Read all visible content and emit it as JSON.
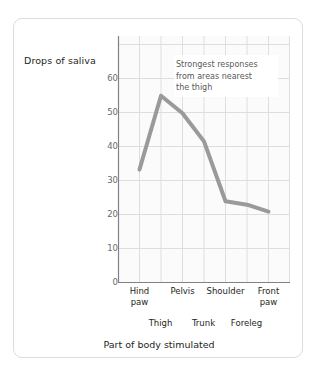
{
  "chart_data": {
    "type": "line",
    "title": "",
    "xlabel": "Part of body stimulated",
    "ylabel": "Drops of saliva",
    "categories": [
      "Hind paw",
      "Thigh",
      "Pelvis",
      "Trunk",
      "Shoulder",
      "Foreleg",
      "Front paw"
    ],
    "values": [
      32,
      53,
      48,
      40,
      23,
      22,
      20
    ],
    "ylim": [
      0,
      70
    ],
    "yticks": [
      0,
      10,
      20,
      30,
      40,
      50,
      60
    ],
    "ytick_labels": [
      "0",
      "10",
      "20",
      "30",
      "40",
      "50",
      "60"
    ],
    "grid": true,
    "legend": "none",
    "series_color": "#9a9a9a",
    "grid_color": "#dcdee0",
    "axis_color": "#808285",
    "annotations": [
      {
        "lines": [
          "Strongest responses",
          "from areas nearest",
          "the thigh"
        ],
        "text": "Strongest responses from areas nearest the thigh"
      }
    ]
  },
  "axis": {
    "y_title": "Drops of saliva",
    "x_title": "Part of body stimulated",
    "y_ticks": [
      "60",
      "50",
      "40",
      "30",
      "20",
      "10",
      "0"
    ],
    "x_labels_top": [
      "Hind paw",
      "Pelvis",
      "Shoulder",
      "Front paw"
    ],
    "x_labels_bottom": [
      "Thigh",
      "Trunk",
      "Foreleg"
    ],
    "x_labels_top_wrapped": [
      [
        "Hind",
        "paw"
      ],
      [
        "Pelvis"
      ],
      [
        "Shoulder"
      ],
      [
        "Front",
        "paw"
      ]
    ]
  },
  "annotation": {
    "line1": "Strongest responses",
    "line2": "from areas nearest",
    "line3": "the thigh"
  },
  "colors": {
    "line": "#9a9a9a",
    "grid": "#dcdee0",
    "axis": "#808285",
    "card_border": "#dcdcdc",
    "plot_background": "#fbfbfb",
    "text": "#231f20",
    "muted_text": "#6a6a6a"
  }
}
